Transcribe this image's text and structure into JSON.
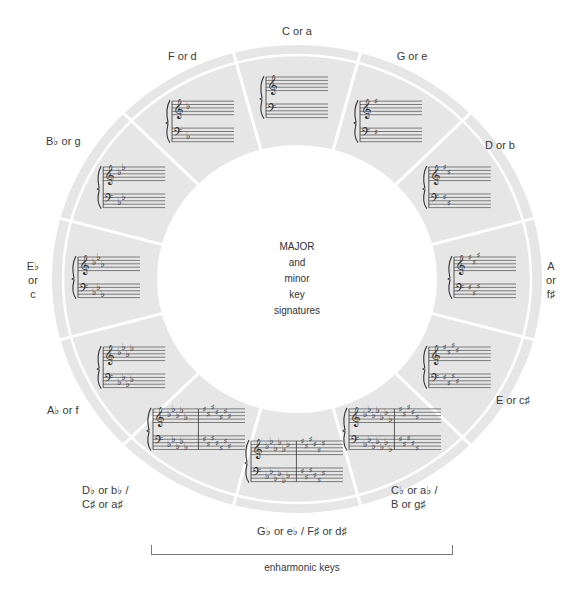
{
  "center": {
    "lines": [
      "MAJOR",
      "and",
      "minor",
      "key",
      "signatures"
    ]
  },
  "colors": {
    "ring_fill": "#e6e6e6",
    "divider": "#ffffff",
    "staff_ink": "#333333",
    "background": "#ffffff"
  },
  "geometry": {
    "cx": 297,
    "cy": 279,
    "outer_rx": 245,
    "outer_ry": 234,
    "inner_rx": 140,
    "inner_ry": 134,
    "band_rx": 234,
    "band_ry": 224,
    "segment_degrees": 30
  },
  "segments": [
    {
      "angle": 0,
      "label": [
        "C or a"
      ],
      "treble": [],
      "treble2": null,
      "type": "none"
    },
    {
      "angle": 30,
      "label": [
        "G or e"
      ],
      "sig": {
        "sharps": 1,
        "flats": 0
      }
    },
    {
      "angle": 60,
      "label": [
        "D or b"
      ],
      "sig": {
        "sharps": 2,
        "flats": 0
      }
    },
    {
      "angle": 90,
      "label": [
        "A",
        "or",
        "f♯"
      ],
      "sig": {
        "sharps": 3,
        "flats": 0
      }
    },
    {
      "angle": 120,
      "label": [
        "E or c♯"
      ],
      "sig": {
        "sharps": 4,
        "flats": 0
      }
    },
    {
      "angle": 150,
      "label": [
        "C♭ or a♭ /",
        "B or g♯"
      ],
      "sig": {
        "flats": 7,
        "sharps": 5,
        "enharmonic": true
      }
    },
    {
      "angle": 180,
      "label": [
        "G♭ or e♭ / F♯ or d♯"
      ],
      "sig": {
        "flats": 6,
        "sharps": 6,
        "enharmonic": true
      }
    },
    {
      "angle": 210,
      "label": [
        "D♭ or b♭ /",
        "C♯ or a♯"
      ],
      "sig": {
        "flats": 5,
        "sharps": 7,
        "enharmonic": true
      }
    },
    {
      "angle": 240,
      "label": [
        "A♭ or f"
      ],
      "sig": {
        "sharps": 0,
        "flats": 4
      }
    },
    {
      "angle": 270,
      "label": [
        "E♭",
        "or",
        "c"
      ],
      "sig": {
        "sharps": 0,
        "flats": 3
      }
    },
    {
      "angle": 300,
      "label": [
        "B♭ or g"
      ],
      "sig": {
        "sharps": 0,
        "flats": 2
      }
    },
    {
      "angle": 330,
      "label": [
        "F or d"
      ],
      "sig": {
        "sharps": 0,
        "flats": 1
      }
    }
  ],
  "labels": {
    "c": {
      "lines": [
        "C or a"
      ],
      "x": 297,
      "y": 31
    },
    "g": {
      "lines": [
        "G or e"
      ],
      "x": 412,
      "y": 56
    },
    "d": {
      "lines": [
        "D or b"
      ],
      "x": 500,
      "y": 145
    },
    "a": {
      "lines": [
        "A",
        "or",
        "f♯"
      ],
      "x": 551,
      "y": 280
    },
    "e": {
      "lines": [
        "E or c♯"
      ],
      "x": 513,
      "y": 400
    },
    "cb": {
      "lines": [
        "C♭ or a♭ /",
        "B or g♯"
      ],
      "x": 423,
      "y": 497
    },
    "gb": {
      "lines": [
        "G♭ or e♭ / F♯ or d♯"
      ],
      "x": 302,
      "y": 531
    },
    "db": {
      "lines": [
        "D♭ or b♭ /",
        "C♯ or a♯"
      ],
      "x": 120,
      "y": 497
    },
    "ab": {
      "lines": [
        "A♭ or f"
      ],
      "x": 63,
      "y": 410
    },
    "eb": {
      "lines": [
        "E♭",
        "or",
        "c"
      ],
      "x": 33,
      "y": 280
    },
    "bb": {
      "lines": [
        "B♭ or g"
      ],
      "x": 68,
      "y": 141
    },
    "f": {
      "lines": [
        "F or d"
      ],
      "x": 186,
      "y": 56
    }
  },
  "bracket": {
    "label": "enharmonic keys"
  }
}
